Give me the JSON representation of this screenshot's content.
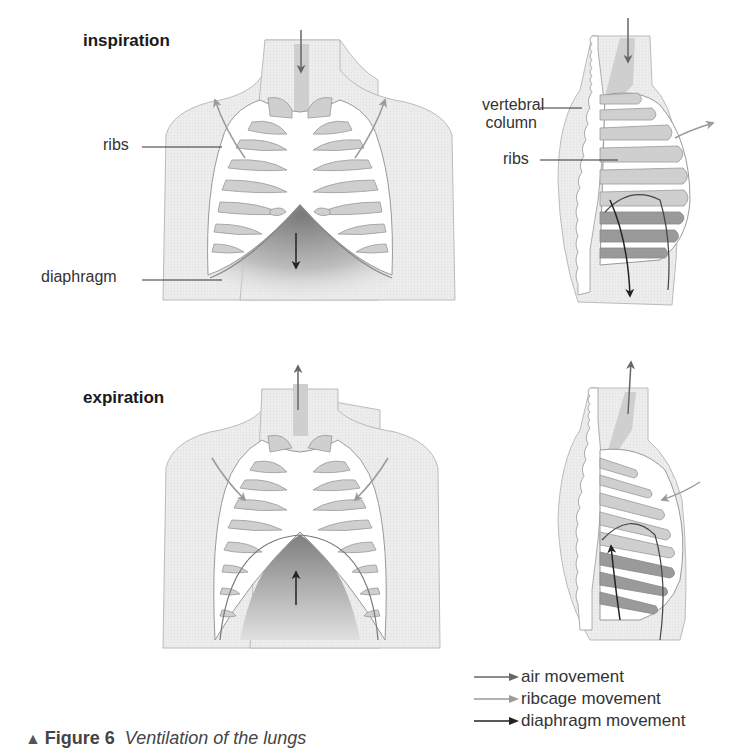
{
  "panels": {
    "inspiration": {
      "heading": "inspiration",
      "labels": {
        "ribs_front": "ribs",
        "diaphragm": "diaphragm",
        "vertebral_column_line1": "vertebral",
        "vertebral_column_line2": "column",
        "ribs_side": "ribs"
      }
    },
    "expiration": {
      "heading": "expiration"
    }
  },
  "legend": [
    {
      "label": "air movement",
      "color": "#666666"
    },
    {
      "label": "ribcage movement",
      "color": "#9a9a9a"
    },
    {
      "label": "diaphragm movement",
      "color": "#222222"
    }
  ],
  "caption": {
    "marker": "▲",
    "number": "Figure 6",
    "title": "Ventilation of the lungs"
  },
  "colors": {
    "body_fill": "#ececec",
    "body_stroke": "#b5b5b5",
    "rib_fill": "#ffffff",
    "lung_fill": "#cfcfcf",
    "dark_lung": "#9a9a9a",
    "air_arrow": "#666666",
    "ribcage_arrow": "#9a9a9a",
    "diaphragm_arrow": "#222222"
  }
}
